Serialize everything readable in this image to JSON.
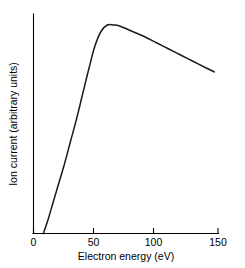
{
  "chart_data": {
    "type": "line",
    "title": "",
    "xlabel": "Electron energy (eV)",
    "ylabel": "Ion current (arbitrary units)",
    "xlim": [
      0,
      150
    ],
    "ylim": [
      0,
      1.05
    ],
    "grid": false,
    "legend": null,
    "xticks": [
      {
        "value": 0,
        "label": "0"
      },
      {
        "value": 50,
        "label": "50"
      },
      {
        "value": 100,
        "label": "100"
      },
      {
        "value": 150,
        "label": "150"
      }
    ],
    "yticks": [],
    "series": [
      {
        "name": "Ionization efficiency curve",
        "x": [
          8,
          12,
          16,
          20,
          25,
          30,
          35,
          40,
          45,
          50,
          55,
          60,
          65,
          70,
          80,
          90,
          100,
          110,
          120,
          130,
          140,
          147
        ],
        "values": [
          0.0,
          0.07,
          0.15,
          0.23,
          0.33,
          0.44,
          0.55,
          0.67,
          0.79,
          0.9,
          0.97,
          1.0,
          1.0,
          0.995,
          0.97,
          0.945,
          0.915,
          0.885,
          0.855,
          0.825,
          0.795,
          0.775
        ]
      }
    ],
    "annotations": {
      "appearance_potential_eV": 8,
      "peak_energy_eV": 60,
      "peak_value": 1.0
    }
  },
  "axes": {
    "x_axis_name": "x-axis",
    "y_axis_name": "y-axis"
  }
}
